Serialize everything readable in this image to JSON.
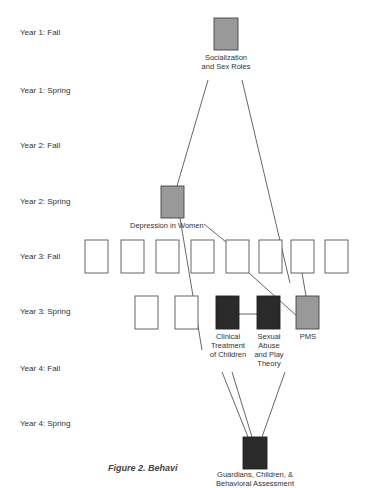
{
  "rows": [
    {
      "label": "Year 1:  Fall"
    },
    {
      "label": "Year 1:  Spring"
    },
    {
      "label": "Year 2:  Fall"
    },
    {
      "label": "Year 2:  Spring"
    },
    {
      "label": "Year 3:  Fall"
    },
    {
      "label": "Year 3:  Spring"
    },
    {
      "label": "Year 4:  Fall"
    },
    {
      "label": "Year 4:  Spring"
    }
  ],
  "nodes": {
    "socialization": {
      "label_line1": "Socialization",
      "label_line2": "and Sex Roles",
      "fill": "gray"
    },
    "depression": {
      "label": "Depression  in Women",
      "fill": "gray"
    },
    "clinical": {
      "label_line1": "Clinical",
      "label_line2": "Treatment",
      "label_line3": "of Children",
      "fill": "black"
    },
    "sexual_abuse": {
      "label_line1": "Sexual",
      "label_line2": "Abuse",
      "label_line3": "and Play",
      "label_line4": "Theory",
      "fill": "black"
    },
    "pms": {
      "label": "PMS",
      "fill": "gray"
    },
    "guardians": {
      "label_line1": "Guardians, Children, &",
      "label_line2": "Behavioral Assessment",
      "fill": "black"
    }
  },
  "caption": "Figure 2. Behavi",
  "colors": {
    "gray": "#999999",
    "black": "#2a2a2a",
    "empty": "#ffffff",
    "stroke": "#555555"
  }
}
